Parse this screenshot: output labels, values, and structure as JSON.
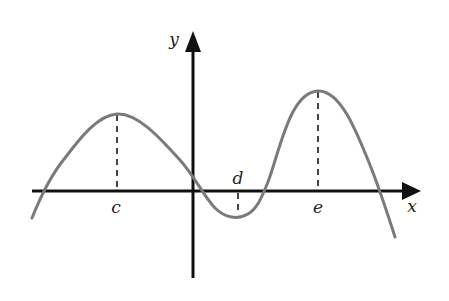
{
  "figure": {
    "type": "function-graph",
    "axes": {
      "x_label": "x",
      "y_label": "y"
    },
    "points": {
      "c": {
        "label": "c",
        "kind": "local maximum"
      },
      "d": {
        "label": "d",
        "kind": "local minimum"
      },
      "e": {
        "label": "e",
        "kind": "local maximum"
      }
    },
    "colors": {
      "axis": "#111111",
      "curve": "#7a7a7a",
      "dashed": "#444444",
      "label": "#222222"
    }
  }
}
